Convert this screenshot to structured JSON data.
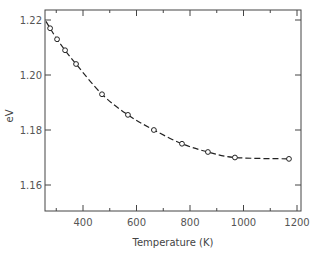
{
  "chart_data": {
    "type": "line",
    "title": "",
    "xlabel": "Temperature (K)",
    "ylabel": "eV",
    "xlim": [
      255,
      1215
    ],
    "ylim": [
      1.1476,
      1.2237
    ],
    "xticks_major": [
      400,
      600,
      800,
      1000,
      1200
    ],
    "xticks_minor": [
      300,
      500,
      700,
      900,
      1100
    ],
    "yticks": [
      1.16,
      1.18,
      1.2,
      1.22
    ],
    "xtick_labels": [
      "400",
      "600",
      "800",
      "1000",
      "1200"
    ],
    "ytick_labels": [
      "1.16",
      "1.18",
      "1.20",
      "1.22"
    ],
    "grid": false,
    "legend": null,
    "series": [
      {
        "name": "Band gap",
        "marker": "open-circle",
        "line_style": "dashed",
        "x": [
          277,
          303,
          333,
          374,
          471,
          568,
          665,
          770,
          867,
          968,
          1170
        ],
        "y": [
          1.217,
          1.213,
          1.209,
          1.204,
          1.193,
          1.1855,
          1.18,
          1.175,
          1.172,
          1.17,
          1.1695
        ]
      }
    ]
  },
  "colors": {
    "axis": "#444444",
    "line": "#222222",
    "marker_edge": "#222222",
    "background": "#ffffff"
  }
}
